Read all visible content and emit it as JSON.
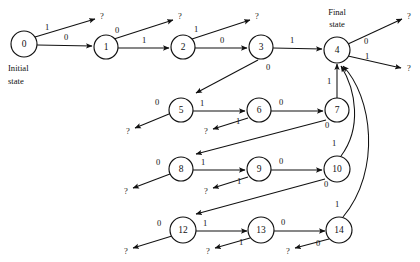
{
  "figure": {
    "type": "state-transition-diagram",
    "background_color": "#ffffff",
    "ink_color": "#111111",
    "width": 420,
    "height": 262
  },
  "annotations": [
    {
      "id": "initial-state",
      "lines": [
        "Initial",
        "state"
      ],
      "line1": "Initial",
      "line2": "state",
      "x": 10,
      "y": 68
    },
    {
      "id": "final-state",
      "lines": [
        "Final",
        "state"
      ],
      "line1": "Final",
      "line2": "state",
      "x": 337,
      "y": 14
    }
  ],
  "nodes": [
    {
      "id": "0",
      "label": "0",
      "x": 24,
      "y": 44,
      "r": 13
    },
    {
      "id": "1",
      "label": "1",
      "x": 106,
      "y": 47,
      "r": 12
    },
    {
      "id": "2",
      "label": "2",
      "x": 183,
      "y": 47,
      "r": 12
    },
    {
      "id": "3",
      "label": "3",
      "x": 261,
      "y": 47,
      "r": 12
    },
    {
      "id": "4",
      "label": "4",
      "x": 337,
      "y": 50,
      "r": 13
    },
    {
      "id": "5",
      "label": "5",
      "x": 181,
      "y": 110,
      "r": 12
    },
    {
      "id": "6",
      "label": "6",
      "x": 259,
      "y": 110,
      "r": 12
    },
    {
      "id": "7",
      "label": "7",
      "x": 337,
      "y": 110,
      "r": 12
    },
    {
      "id": "8",
      "label": "8",
      "x": 181,
      "y": 169,
      "r": 12
    },
    {
      "id": "9",
      "label": "9",
      "x": 259,
      "y": 169,
      "r": 12
    },
    {
      "id": "10",
      "label": "10",
      "x": 337,
      "y": 169,
      "r": 13
    },
    {
      "id": "12",
      "label": "12",
      "x": 183,
      "y": 230,
      "r": 13
    },
    {
      "id": "13",
      "label": "13",
      "x": 261,
      "y": 230,
      "r": 13
    },
    {
      "id": "14",
      "label": "14",
      "x": 339,
      "y": 230,
      "r": 13
    }
  ],
  "terminals": [
    {
      "id": "t0",
      "label": "?",
      "x": 102,
      "y": 17
    },
    {
      "id": "t1",
      "label": "?",
      "x": 180,
      "y": 17
    },
    {
      "id": "t2",
      "label": "?",
      "x": 257,
      "y": 17
    },
    {
      "id": "t4a",
      "label": "?",
      "x": 409,
      "y": 17
    },
    {
      "id": "t4b",
      "label": "?",
      "x": 409,
      "y": 67
    },
    {
      "id": "t3",
      "label": "?",
      "x": 128,
      "y": 131
    },
    {
      "id": "t5",
      "label": "?",
      "x": 129,
      "y": 131
    },
    {
      "id": "t6",
      "label": "?",
      "x": 206,
      "y": 131
    },
    {
      "id": "t7",
      "label": "?",
      "x": 126,
      "y": 191
    },
    {
      "id": "t9",
      "label": "?",
      "x": 206,
      "y": 191
    },
    {
      "id": "t10",
      "label": "?",
      "x": 126,
      "y": 251
    },
    {
      "id": "t13",
      "label": "?",
      "x": 208,
      "y": 251
    },
    {
      "id": "t14",
      "label": "?",
      "x": 288,
      "y": 251
    }
  ],
  "transitions": [
    {
      "from": "0",
      "to": "?",
      "symbol": "1",
      "label_x": 47,
      "label_y": 28
    },
    {
      "from": "0",
      "to": "1",
      "symbol": "0",
      "label_x": 66,
      "label_y": 38
    },
    {
      "from": "1",
      "to": "?",
      "symbol": "0",
      "label_x": 117,
      "label_y": 31
    },
    {
      "from": "1",
      "to": "2",
      "symbol": "1",
      "label_x": 144,
      "label_y": 41
    },
    {
      "from": "2",
      "to": "?",
      "symbol": "1",
      "label_x": 196,
      "label_y": 30
    },
    {
      "from": "2",
      "to": "3",
      "symbol": "0",
      "label_x": 222,
      "label_y": 41
    },
    {
      "from": "3",
      "to": "4",
      "symbol": "1",
      "label_x": 292,
      "label_y": 41
    },
    {
      "from": "3",
      "to": "?",
      "symbol": "0",
      "label_x": 268,
      "label_y": 68
    },
    {
      "from": "4",
      "to": "?",
      "symbol": "0",
      "label_x": 366,
      "label_y": 42
    },
    {
      "from": "4",
      "to": "?",
      "symbol": "1",
      "label_x": 367,
      "label_y": 57
    },
    {
      "from": "5",
      "to": "?",
      "symbol": "0",
      "label_x": 157,
      "label_y": 103
    },
    {
      "from": "5",
      "to": "6",
      "symbol": "1",
      "label_x": 202,
      "label_y": 104
    },
    {
      "from": "6",
      "to": "7",
      "symbol": "0",
      "label_x": 281,
      "label_y": 103
    },
    {
      "from": "6",
      "to": "?",
      "symbol": "1",
      "label_x": 238,
      "label_y": 122
    },
    {
      "from": "7",
      "to": "4",
      "symbol": "1",
      "label_x": 329,
      "label_y": 82
    },
    {
      "from": "7",
      "to": "?",
      "symbol": "0",
      "label_x": 327,
      "label_y": 126
    },
    {
      "from": "8",
      "to": "?",
      "symbol": "0",
      "label_x": 158,
      "label_y": 163
    },
    {
      "from": "8",
      "to": "9",
      "symbol": "1",
      "label_x": 203,
      "label_y": 163
    },
    {
      "from": "9",
      "to": "10",
      "symbol": "0",
      "label_x": 281,
      "label_y": 162
    },
    {
      "from": "9",
      "to": "?",
      "symbol": "1",
      "label_x": 239,
      "label_y": 182
    },
    {
      "from": "10",
      "to": "4",
      "symbol": "1",
      "label_x": 334,
      "label_y": 144
    },
    {
      "from": "10",
      "to": "?",
      "symbol": "0",
      "label_x": 326,
      "label_y": 185
    },
    {
      "from": "12",
      "to": "?",
      "symbol": "0",
      "label_x": 159,
      "label_y": 224
    },
    {
      "from": "12",
      "to": "13",
      "symbol": "1",
      "label_x": 205,
      "label_y": 224
    },
    {
      "from": "13",
      "to": "14",
      "symbol": "0",
      "label_x": 283,
      "label_y": 223
    },
    {
      "from": "13",
      "to": "?",
      "symbol": "1",
      "label_x": 241,
      "label_y": 243
    },
    {
      "from": "14",
      "to": "4",
      "symbol": "1",
      "label_x": 337,
      "label_y": 205
    },
    {
      "from": "14",
      "to": "?",
      "symbol": "0",
      "label_x": 318,
      "label_y": 244
    }
  ]
}
